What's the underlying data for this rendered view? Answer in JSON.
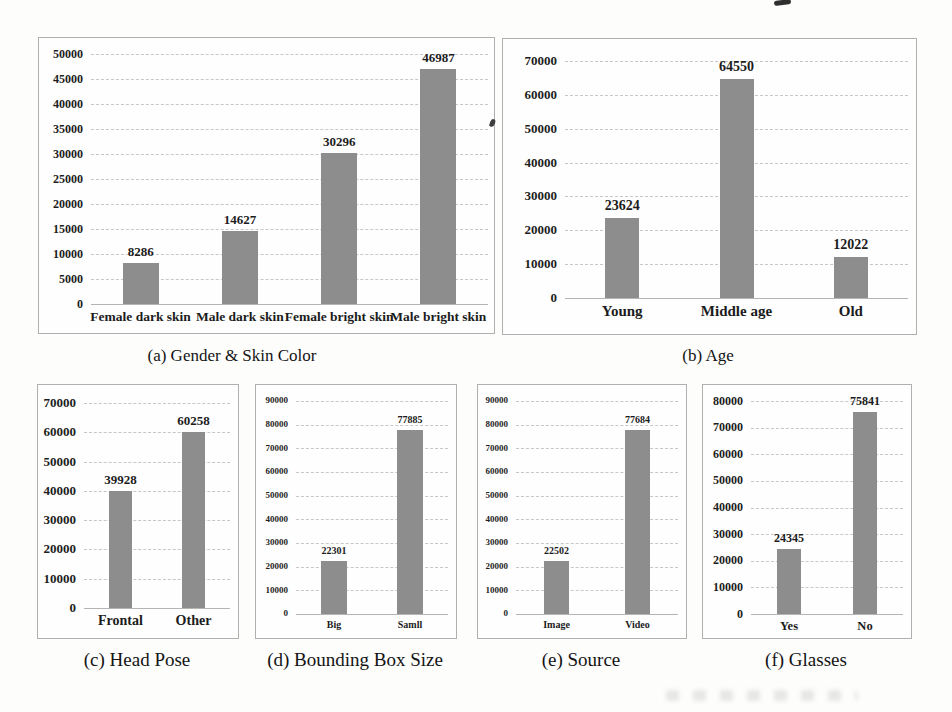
{
  "figure": {
    "background": "#fdfdfc",
    "bar_color": "#8d8d8d",
    "grid_color": "#c7c7c5",
    "border_color": "#b0b0ae",
    "grid_style": "dashed-horizontal",
    "legend": false
  },
  "chart_data": [
    {
      "id": "gender-skin-color",
      "type": "bar",
      "title": "(a) Gender & Skin Color",
      "categories": [
        "Female dark skin",
        "Male dark skin",
        "Female bright skin",
        "Male bright skin"
      ],
      "values": [
        8286,
        14627,
        30296,
        46987
      ],
      "ylim": [
        0,
        50000
      ],
      "ystep": 5000,
      "yticks": [
        0,
        5000,
        10000,
        15000,
        20000,
        25000,
        30000,
        35000,
        40000,
        45000,
        50000
      ],
      "grid": true
    },
    {
      "id": "age",
      "type": "bar",
      "title": "(b) Age",
      "categories": [
        "Young",
        "Middle age",
        "Old"
      ],
      "values": [
        23624,
        64550,
        12022
      ],
      "ylim": [
        0,
        70000
      ],
      "ystep": 10000,
      "yticks": [
        0,
        10000,
        20000,
        30000,
        40000,
        50000,
        60000,
        70000
      ],
      "grid": true
    },
    {
      "id": "head-pose",
      "type": "bar",
      "title": "(c) Head Pose",
      "categories": [
        "Frontal",
        "Other"
      ],
      "values": [
        39928,
        60258
      ],
      "ylim": [
        0,
        70000
      ],
      "ystep": 10000,
      "yticks": [
        0,
        10000,
        20000,
        30000,
        40000,
        50000,
        60000,
        70000
      ],
      "grid": true
    },
    {
      "id": "bounding-box-size",
      "type": "bar",
      "title": "(d) Bounding Box Size",
      "categories": [
        "Big",
        "Samll"
      ],
      "values": [
        22301,
        77885
      ],
      "ylim": [
        0,
        90000
      ],
      "ystep": 10000,
      "yticks": [
        0,
        10000,
        20000,
        30000,
        40000,
        50000,
        60000,
        70000,
        80000,
        90000
      ],
      "grid": true
    },
    {
      "id": "source",
      "type": "bar",
      "title": "(e) Source",
      "categories": [
        "Image",
        "Video"
      ],
      "values": [
        22502,
        77684
      ],
      "ylim": [
        0,
        90000
      ],
      "ystep": 10000,
      "yticks": [
        0,
        10000,
        20000,
        30000,
        40000,
        50000,
        60000,
        70000,
        80000,
        90000
      ],
      "grid": true
    },
    {
      "id": "glasses",
      "type": "bar",
      "title": "(f) Glasses",
      "categories": [
        "Yes",
        "No"
      ],
      "values": [
        24345,
        75841
      ],
      "ylim": [
        0,
        80000
      ],
      "ystep": 10000,
      "yticks": [
        0,
        10000,
        20000,
        30000,
        40000,
        50000,
        60000,
        70000,
        80000
      ],
      "grid": true
    }
  ],
  "artifacts": {
    "top_edge_fragment": "ink-fragment",
    "between_charts_mark": "comma-like-speck",
    "bottom_bleedthrough": "faint-smudge"
  }
}
